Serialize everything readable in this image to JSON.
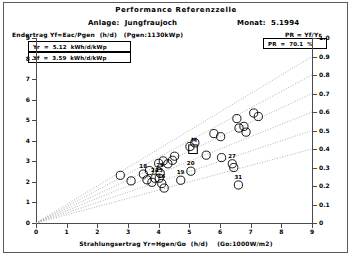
{
  "window": {
    "title": "Performance Referenzzelle"
  },
  "header": {
    "title": "Performance Referenzzelle",
    "plant_label": "Anlage:  Jungfraujoch",
    "month_label": "Monat:  5.1994",
    "yield_definition": "Endertrag Yf=Eac/Pgen  (h/d)   (Pgen:1130kWp)",
    "pr_definition": "PR = Yf/Yr"
  },
  "legend": {
    "yr_box": "Yr  =  5.12  kWh/d/kWp",
    "yf_box": "Yf  =  3.59  kWh/d/kWp",
    "pr_box": "PR  =  70.1  %"
  },
  "axes": {
    "x_title": "Strahlungsertrag Yr=Hgen/Go  (h/d)    (Go:1000W/m2)",
    "x_ticks": [
      "0",
      "1",
      "2",
      "3",
      "4",
      "5",
      "6",
      "7",
      "8",
      "9"
    ],
    "y_left_ticks": [
      "0",
      "1",
      "2",
      "3",
      "4",
      "5",
      "6",
      "7",
      "8",
      "9"
    ],
    "y_right_ticks": [
      "0",
      "0.1",
      "0.2",
      "0.3",
      "0.4",
      "0.5",
      "0.6",
      "0.7",
      "0.8",
      "0.9",
      "1.0"
    ],
    "x_min": 0,
    "x_max": 9,
    "y_left_min": 0,
    "y_left_max": 9,
    "y_right_min": 0,
    "y_right_max": 1.0
  },
  "colors": {
    "ink": "#000000",
    "axis": "#4a4a4a",
    "grid": "#909090",
    "frame": "#5a5a5a",
    "background": "#ffffff"
  },
  "chart_data": {
    "type": "scatter",
    "title": "Performance Referenzzelle",
    "xlabel": "Strahlungsertrag Yr=Hgen/Go  (h/d)    (Go:1000W/m2)",
    "ylabel": "Endertrag Yf=Eac/Pgen  (h/d)",
    "ylabel_right": "PR = Yf/Yr",
    "xlim": [
      0,
      9
    ],
    "ylim": [
      0,
      9
    ],
    "ylim_right": [
      0,
      1.0
    ],
    "grid": false,
    "legend_position": "top-left",
    "marker": "open-circle",
    "mean_marker": "open-square",
    "ratio_lines": [
      0.9,
      0.8,
      0.7,
      0.6,
      0.5,
      0.4
    ],
    "ratio_line_style": "dotted",
    "mean_point": {
      "label": "M",
      "x": 5.12,
      "y": 3.59,
      "pr": 0.701
    },
    "points": [
      {
        "label": "",
        "x": 2.75,
        "y": 2.32
      },
      {
        "label": "",
        "x": 3.1,
        "y": 2.05
      },
      {
        "label": "18",
        "x": 3.5,
        "y": 2.38
      },
      {
        "label": "",
        "x": 3.62,
        "y": 2.1
      },
      {
        "label": "",
        "x": 3.7,
        "y": 2.55
      },
      {
        "label": "",
        "x": 3.78,
        "y": 1.98
      },
      {
        "label": "24",
        "x": 3.88,
        "y": 2.18
      },
      {
        "label": "25",
        "x": 4.02,
        "y": 2.18
      },
      {
        "label": "16",
        "x": 4.1,
        "y": 1.92
      },
      {
        "label": "",
        "x": 4.18,
        "y": 1.7
      },
      {
        "label": "29",
        "x": 4.05,
        "y": 2.42
      },
      {
        "label": "",
        "x": 4.0,
        "y": 2.9
      },
      {
        "label": "",
        "x": 4.15,
        "y": 3.02
      },
      {
        "label": "",
        "x": 4.3,
        "y": 2.88
      },
      {
        "label": "",
        "x": 4.45,
        "y": 3.05
      },
      {
        "label": "",
        "x": 4.52,
        "y": 3.25
      },
      {
        "label": "19",
        "x": 4.72,
        "y": 2.08
      },
      {
        "label": "20",
        "x": 5.05,
        "y": 2.52
      },
      {
        "label": "",
        "x": 5.02,
        "y": 3.72
      },
      {
        "label": "",
        "x": 5.18,
        "y": 3.9
      },
      {
        "label": "",
        "x": 5.55,
        "y": 3.3
      },
      {
        "label": "",
        "x": 5.8,
        "y": 4.35
      },
      {
        "label": "",
        "x": 6.02,
        "y": 4.2
      },
      {
        "label": "",
        "x": 6.05,
        "y": 3.18
      },
      {
        "label": "27",
        "x": 6.4,
        "y": 2.88
      },
      {
        "label": "",
        "x": 6.45,
        "y": 2.7
      },
      {
        "label": "",
        "x": 6.62,
        "y": 4.62
      },
      {
        "label": "",
        "x": 6.78,
        "y": 4.7
      },
      {
        "label": "",
        "x": 6.85,
        "y": 4.42
      },
      {
        "label": "",
        "x": 6.55,
        "y": 5.08
      },
      {
        "label": "31",
        "x": 6.6,
        "y": 1.85
      },
      {
        "label": "",
        "x": 7.1,
        "y": 5.35
      },
      {
        "label": "",
        "x": 7.25,
        "y": 5.18
      }
    ]
  }
}
